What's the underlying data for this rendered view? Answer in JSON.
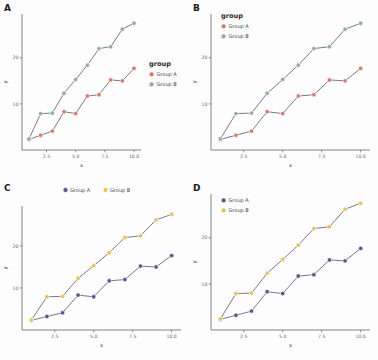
{
  "figure": {
    "background": "#fdfdfd",
    "line_color": "#4a4f58",
    "axis_color": "#4d4d4d",
    "tick_text_color": "#6b6b6b"
  },
  "axes": {
    "xlabel": "x",
    "ylabel": "y",
    "xticks": [
      "2.5",
      "5.0",
      "7.5",
      "10.0"
    ],
    "xtick_values": [
      2.5,
      5.0,
      7.5,
      10.0
    ],
    "yticks": [
      "10",
      "20"
    ],
    "ytick_values": [
      10,
      20
    ],
    "xlim": [
      0.4,
      10.6
    ],
    "ylim": [
      0.0,
      29.5
    ],
    "grid": "off"
  },
  "panels": [
    {
      "tag": "A",
      "legend": {
        "title": "group",
        "position": "right",
        "orientation": "vertical",
        "show_title": true,
        "entries": [
          {
            "label": "Group A",
            "color": "#d9796b"
          },
          {
            "label": "Group B",
            "color": "#8fada8"
          }
        ]
      }
    },
    {
      "tag": "B",
      "legend": {
        "title": "group",
        "position": "inside-top-left",
        "orientation": "vertical",
        "show_title": true,
        "entries": [
          {
            "label": "Group A",
            "color": "#d9796b"
          },
          {
            "label": "Group B",
            "color": "#8fada8"
          }
        ]
      }
    },
    {
      "tag": "C",
      "legend": {
        "title": "",
        "position": "top",
        "orientation": "horizontal",
        "show_title": false,
        "entries": [
          {
            "label": "Group A",
            "color": "#4e5d87"
          },
          {
            "label": "Group B",
            "color": "#e2c45e"
          }
        ]
      }
    },
    {
      "tag": "D",
      "legend": {
        "title": "",
        "position": "inside-top-left",
        "orientation": "vertical",
        "show_title": false,
        "entries": [
          {
            "label": "Group A",
            "color": "#4e5d87"
          },
          {
            "label": "Group B",
            "color": "#e2c45e"
          }
        ]
      }
    }
  ],
  "chart_data": {
    "type": "line",
    "title": "",
    "xlabel": "x",
    "ylabel": "y",
    "xlim": [
      0.4,
      10.6
    ],
    "ylim": [
      0.0,
      29.5
    ],
    "grid": "off",
    "x": [
      1,
      2,
      3,
      4,
      5,
      6,
      7,
      8,
      9,
      10
    ],
    "series": [
      {
        "name": "Group A",
        "values": [
          2.3,
          3.2,
          4.1,
          8.3,
          7.9,
          11.7,
          12.0,
          15.2,
          15.0,
          17.7
        ],
        "color_ab": "#d9796b",
        "color_cd": "#4e5d87"
      },
      {
        "name": "Group B",
        "values": [
          2.4,
          7.9,
          8.0,
          12.3,
          15.3,
          18.4,
          22.0,
          22.4,
          26.2,
          27.5
        ],
        "color_ab": "#8fada8",
        "color_cd": "#e2c45e"
      }
    ],
    "legend_variants": [
      "right-with-title",
      "inside-top-left-with-title",
      "top-horizontal-no-title",
      "inside-top-left-no-title"
    ]
  }
}
